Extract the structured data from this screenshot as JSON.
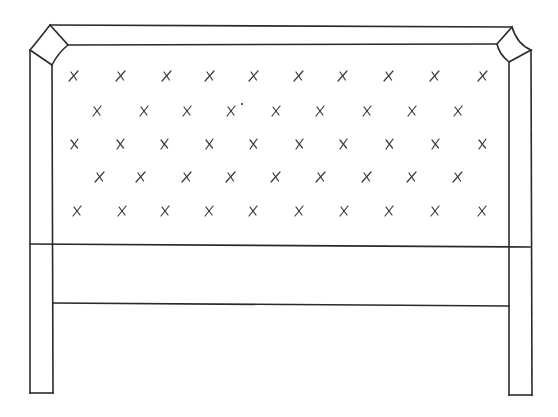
{
  "drawing": {
    "subject": "tufted headboard line drawing",
    "stroke_color": "#2a2a2a",
    "background": "#ffffff",
    "frame": {
      "top_outer": [
        [
          50,
          25
        ],
        [
          512,
          27
        ]
      ],
      "top_inner": [
        [
          68,
          45
        ],
        [
          497,
          44
        ]
      ],
      "left_post": {
        "outer_x": 30,
        "inner_x": 52,
        "top_outer_y": 50,
        "top_inner_y": 65,
        "bottom_y": 393
      },
      "right_post": {
        "outer_x": 531,
        "inner_x": 509,
        "top_outer_y": 50,
        "top_inner_y": 62,
        "bottom_y": 395
      },
      "panel_bottom_line": [
        [
          30,
          244
        ],
        [
          530,
          247
        ]
      ],
      "lower_rail_line": [
        [
          53,
          303
        ],
        [
          509,
          306
        ]
      ]
    },
    "corner_ornaments": {
      "left": {
        "top": [
          50,
          25
        ],
        "right": [
          68,
          45
        ],
        "bottom": [
          52,
          65
        ],
        "left": [
          30,
          50
        ]
      },
      "right": {
        "top": [
          512,
          27
        ],
        "right": [
          531,
          50
        ],
        "bottom": [
          509,
          62
        ],
        "left": [
          497,
          44
        ]
      }
    },
    "tuft_rows": [
      {
        "y": 76,
        "xs": [
          74,
          121,
          167,
          210,
          254,
          299,
          343,
          389,
          435,
          483
        ]
      },
      {
        "y": 111,
        "xs": [
          97,
          144,
          187,
          231,
          276,
          320,
          367,
          412,
          458
        ]
      },
      {
        "y": 144,
        "xs": [
          74,
          120,
          164,
          209,
          253,
          299,
          343,
          389,
          435,
          482
        ]
      },
      {
        "y": 177,
        "xs": [
          100,
          141,
          187,
          231,
          276,
          321,
          367,
          412,
          458
        ]
      },
      {
        "y": 211,
        "xs": [
          77,
          122,
          165,
          209,
          253,
          299,
          344,
          389,
          435,
          482
        ]
      }
    ],
    "stray_dot": [
      242,
      104
    ]
  }
}
